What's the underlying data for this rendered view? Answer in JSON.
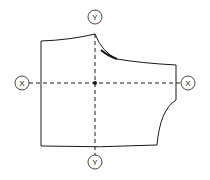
{
  "diagram": {
    "type": "pattern-piece-axes",
    "axis_labels": {
      "y_top": "Y",
      "y_bottom": "Y",
      "x_left": "X",
      "x_right": "X"
    },
    "colors": {
      "line": "#1a1a1a",
      "background": "#ffffff"
    }
  }
}
